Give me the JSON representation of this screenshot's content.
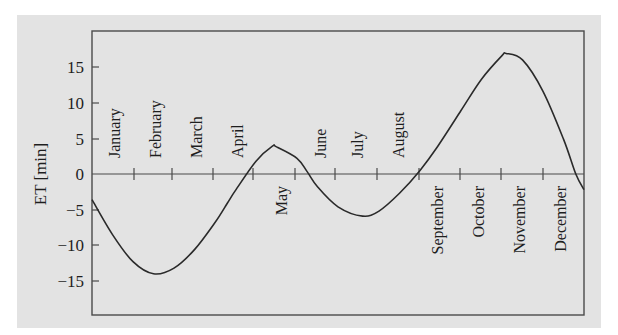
{
  "chart_data": {
    "type": "line",
    "title": "",
    "xlabel": "",
    "ylabel": "ET [min]",
    "ylim": [
      -20,
      20
    ],
    "yticks": [
      15,
      10,
      5,
      0,
      -5,
      -10,
      -15
    ],
    "ytick_labels": [
      "15",
      "10",
      "5",
      "0",
      "−5",
      "−10",
      "−15"
    ],
    "grid": false,
    "legend": null,
    "x_unit": "month of year",
    "month_labels": [
      {
        "name": "January",
        "side": "above"
      },
      {
        "name": "February",
        "side": "above"
      },
      {
        "name": "March",
        "side": "above"
      },
      {
        "name": "April",
        "side": "above"
      },
      {
        "name": "May",
        "side": "below"
      },
      {
        "name": "June",
        "side": "above"
      },
      {
        "name": "July",
        "side": "above"
      },
      {
        "name": "August",
        "side": "above"
      },
      {
        "name": "September",
        "side": "below"
      },
      {
        "name": "October",
        "side": "below"
      },
      {
        "name": "November",
        "side": "below"
      },
      {
        "name": "December",
        "side": "below"
      }
    ],
    "series": [
      {
        "name": "Equation of time",
        "x": [
          0.0,
          0.5,
          1.0,
          1.5,
          2.0,
          2.5,
          3.0,
          3.3,
          3.5,
          4.0,
          4.4,
          4.5,
          5.0,
          5.25,
          5.5,
          6.0,
          6.6,
          7.0,
          7.5,
          8.0,
          8.4,
          9.0,
          9.5,
          10.0,
          10.1,
          10.5,
          11.0,
          11.5,
          11.8,
          12.0
        ],
        "values": [
          -3.6,
          -8.5,
          -12.3,
          -14.0,
          -13.2,
          -10.6,
          -6.8,
          -4.1,
          -2.3,
          1.8,
          3.9,
          3.8,
          2.2,
          0.3,
          -1.8,
          -4.6,
          -5.9,
          -5.2,
          -2.7,
          0.5,
          3.6,
          8.9,
          13.3,
          16.6,
          16.9,
          16.0,
          11.6,
          4.9,
          0.0,
          -2.2
        ]
      }
    ],
    "extrema": [
      {
        "label": "min",
        "month": "February",
        "value": -14.0
      },
      {
        "label": "max",
        "month": "May",
        "value": 3.9
      },
      {
        "label": "min",
        "month": "July",
        "value": -5.9
      },
      {
        "label": "max",
        "month": "November",
        "value": 16.9
      }
    ]
  },
  "labels": {
    "ylabel": "ET [min]",
    "yticks": [
      "15",
      "10",
      "5",
      "0",
      "−5",
      "−10",
      "−15"
    ],
    "months": [
      "January",
      "February",
      "March",
      "April",
      "May",
      "June",
      "July",
      "August",
      "September",
      "October",
      "November",
      "December"
    ]
  },
  "style": {
    "panel_bg": "#e3e3e3",
    "frame_color": "#4a4a4a",
    "curve_color": "#2a2a2a"
  }
}
